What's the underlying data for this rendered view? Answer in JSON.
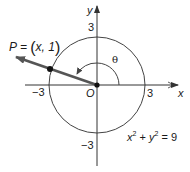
{
  "diagram": {
    "type": "unit-circle-style plot",
    "axes": {
      "x_label": "x",
      "y_label": "y",
      "origin_label": "O",
      "ticks": {
        "x_positive": "3",
        "x_negative": "−3",
        "y_positive": "3",
        "y_negative": "−3"
      }
    },
    "circle": {
      "equation_lhs_x": "x",
      "equation_exp1": "2",
      "equation_plus": " + ",
      "equation_lhs_y": "y",
      "equation_exp2": "2",
      "equation_rhs": " = 9",
      "radius": 3
    },
    "point": {
      "prefix": "P = ",
      "open_paren": "(",
      "coords": "x, 1",
      "close_paren": ")"
    },
    "angle": {
      "label": "θ"
    },
    "colors": {
      "ray": "#555555",
      "axis": "#333333",
      "circle": "#444444",
      "text": "#1a1a1a"
    }
  }
}
